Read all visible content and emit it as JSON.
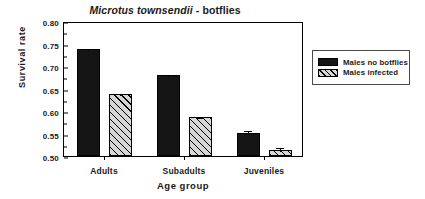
{
  "chart_data": {
    "type": "bar",
    "title": "Microtus townsendii - botflies",
    "title_species": "Microtus townsendii",
    "title_rest": " - botflies",
    "xlabel": "Age group",
    "ylabel": "Survival rate",
    "categories": [
      "Adults",
      "Subadults",
      "Juveniles"
    ],
    "ylim": [
      0.5,
      0.8
    ],
    "yticks": [
      "0.50",
      "0.55",
      "0.60",
      "0.65",
      "0.70",
      "0.75",
      "0.80"
    ],
    "ytick_values": [
      0.5,
      0.55,
      0.6,
      0.65,
      0.7,
      0.75,
      0.8
    ],
    "grid": false,
    "legend_position": "right",
    "series": [
      {
        "name": "Males no botflies",
        "fill": "solid-black",
        "values": [
          0.738,
          0.68,
          0.551
        ],
        "errors": [
          0.005,
          0.004,
          0.008
        ]
      },
      {
        "name": "Males infected",
        "fill": "diagonal-hatch",
        "values": [
          0.637,
          0.586,
          0.514
        ],
        "errors": [
          0.006,
          0.004,
          0.008
        ]
      }
    ]
  },
  "legend": {
    "items": [
      {
        "label": "Males no botflies"
      },
      {
        "label": "Males infected"
      }
    ]
  },
  "colors": {
    "series_1": "#151515",
    "series_2": "#d6d6d6",
    "axis": "#000000",
    "background": "#ffffff"
  }
}
